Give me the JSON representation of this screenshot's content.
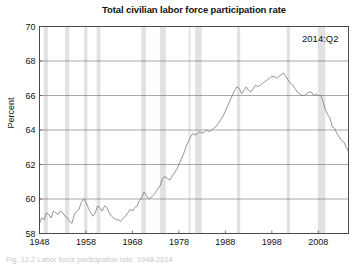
{
  "figure": {
    "title": "Total civilian labor force participation rate",
    "annotation": "2014:Q2",
    "caption": "Fig. 12.2 Labor force participation rate, 1948-2014"
  },
  "axes": {
    "ylabel": "Percent",
    "xlabel": "",
    "yticks": [
      "58",
      "60",
      "62",
      "64",
      "66",
      "68",
      "70"
    ],
    "xticks": [
      "1948",
      "1958",
      "1968",
      "1978",
      "1988",
      "1998",
      "2008"
    ]
  },
  "colors": {
    "line": "#7a7a7a",
    "grid": "#6e6e6e",
    "axis": "#4a4a4a",
    "recession_band": "#e2e2e2",
    "background": "#ffffff",
    "text": "#111111"
  },
  "chart_data": {
    "type": "line",
    "title": "Total civilian labor force participation rate",
    "xlabel": "",
    "ylabel": "Percent",
    "xlim": [
      1948,
      2014.5
    ],
    "ylim": [
      58,
      70
    ],
    "yticks": [
      58,
      60,
      62,
      64,
      66,
      68,
      70
    ],
    "xticks": [
      1948,
      1958,
      1968,
      1978,
      1988,
      1998,
      2008
    ],
    "grid": true,
    "legend": null,
    "annotations": [
      {
        "text": "2014:Q2",
        "x": 2008.5,
        "y": 69.1,
        "position": "top-right-inside"
      }
    ],
    "series": [
      {
        "name": "Total civilian labor force participation rate",
        "units": "percent",
        "frequency": "quarterly",
        "x": [
          1948.0,
          1948.5,
          1949.0,
          1949.5,
          1950.0,
          1950.5,
          1951.0,
          1951.5,
          1952.0,
          1952.5,
          1953.0,
          1953.5,
          1954.0,
          1954.5,
          1955.0,
          1955.5,
          1956.0,
          1956.5,
          1957.0,
          1957.5,
          1958.0,
          1958.5,
          1959.0,
          1959.5,
          1960.0,
          1960.5,
          1961.0,
          1961.5,
          1962.0,
          1962.5,
          1963.0,
          1963.5,
          1964.0,
          1964.5,
          1965.0,
          1965.5,
          1966.0,
          1966.5,
          1967.0,
          1967.5,
          1968.0,
          1968.5,
          1969.0,
          1969.5,
          1970.0,
          1970.5,
          1971.0,
          1971.5,
          1972.0,
          1972.5,
          1973.0,
          1973.5,
          1974.0,
          1974.5,
          1975.0,
          1975.5,
          1976.0,
          1976.5,
          1977.0,
          1977.5,
          1978.0,
          1978.5,
          1979.0,
          1979.5,
          1980.0,
          1980.5,
          1981.0,
          1981.5,
          1982.0,
          1982.5,
          1983.0,
          1983.5,
          1984.0,
          1984.5,
          1985.0,
          1985.5,
          1986.0,
          1986.5,
          1987.0,
          1987.5,
          1988.0,
          1988.5,
          1989.0,
          1989.5,
          1990.0,
          1990.5,
          1991.0,
          1991.5,
          1992.0,
          1992.5,
          1993.0,
          1993.5,
          1994.0,
          1994.5,
          1995.0,
          1995.5,
          1996.0,
          1996.5,
          1997.0,
          1997.5,
          1998.0,
          1998.5,
          1999.0,
          1999.5,
          2000.0,
          2000.5,
          2001.0,
          2001.5,
          2002.0,
          2002.5,
          2003.0,
          2003.5,
          2004.0,
          2004.5,
          2005.0,
          2005.5,
          2006.0,
          2006.5,
          2007.0,
          2007.5,
          2008.0,
          2008.5,
          2009.0,
          2009.5,
          2010.0,
          2010.5,
          2011.0,
          2011.5,
          2012.0,
          2012.5,
          2013.0,
          2013.5,
          2014.0,
          2014.4
        ],
        "y": [
          58.6,
          58.9,
          58.8,
          59.2,
          59.1,
          58.9,
          59.3,
          59.2,
          59.1,
          59.3,
          59.2,
          59.0,
          58.9,
          58.7,
          58.6,
          59.1,
          59.3,
          59.4,
          59.8,
          60.0,
          59.8,
          59.5,
          59.2,
          59.0,
          59.2,
          59.6,
          59.5,
          59.3,
          59.6,
          59.5,
          59.2,
          59.0,
          58.9,
          58.8,
          58.8,
          58.7,
          58.9,
          59.0,
          59.2,
          59.4,
          59.3,
          59.5,
          59.6,
          59.9,
          60.1,
          60.4,
          60.2,
          60.0,
          60.1,
          60.2,
          60.4,
          60.6,
          60.8,
          61.2,
          61.3,
          61.2,
          61.1,
          61.3,
          61.5,
          61.7,
          62.0,
          62.3,
          62.6,
          63.0,
          63.3,
          63.6,
          63.8,
          63.7,
          63.8,
          63.9,
          63.8,
          63.9,
          64.0,
          63.9,
          64.0,
          64.1,
          64.2,
          64.4,
          64.6,
          64.8,
          65.1,
          65.4,
          65.7,
          66.0,
          66.3,
          66.5,
          66.4,
          66.1,
          66.3,
          66.5,
          66.3,
          66.2,
          66.4,
          66.6,
          66.5,
          66.6,
          66.7,
          66.8,
          66.9,
          67.0,
          67.1,
          67.1,
          67.0,
          67.1,
          67.2,
          67.3,
          67.1,
          66.9,
          66.7,
          66.6,
          66.4,
          66.2,
          66.1,
          66.0,
          66.0,
          66.1,
          66.2,
          66.2,
          66.0,
          66.1,
          66.0,
          66.0,
          65.7,
          65.2,
          64.9,
          64.7,
          64.2,
          64.1,
          63.8,
          63.6,
          63.4,
          63.3,
          63.0,
          62.8
        ]
      }
    ],
    "recession_bands": [
      {
        "label": "1948-49",
        "start": 1948.9,
        "end": 1949.8
      },
      {
        "label": "1953-54",
        "start": 1953.5,
        "end": 1954.4
      },
      {
        "label": "1957-58",
        "start": 1957.6,
        "end": 1958.3
      },
      {
        "label": "1960-61",
        "start": 1960.3,
        "end": 1961.1
      },
      {
        "label": "1969-70",
        "start": 1969.9,
        "end": 1970.9
      },
      {
        "label": "1973-75",
        "start": 1973.9,
        "end": 1975.2
      },
      {
        "label": "1980",
        "start": 1980.1,
        "end": 1980.5
      },
      {
        "label": "1981-82",
        "start": 1981.5,
        "end": 1982.9
      },
      {
        "label": "1990-91",
        "start": 1990.5,
        "end": 1991.2
      },
      {
        "label": "2001",
        "start": 2001.2,
        "end": 2001.9
      },
      {
        "label": "2007-09",
        "start": 2007.9,
        "end": 2009.5
      }
    ]
  }
}
